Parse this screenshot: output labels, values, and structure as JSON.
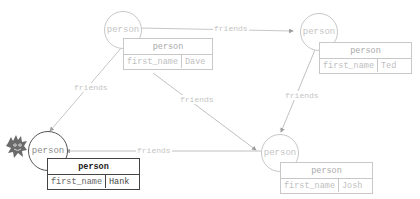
{
  "graph": {
    "nodes": [
      {
        "id": "dave",
        "label": "person",
        "state": "faded",
        "card": {
          "title": "person",
          "key": "first_name",
          "value": "Dave"
        }
      },
      {
        "id": "ted",
        "label": "person",
        "state": "faded",
        "card": {
          "title": "person",
          "key": "first_name",
          "value": "Ted"
        }
      },
      {
        "id": "hank",
        "label": "person",
        "state": "active",
        "card": {
          "title": "person",
          "key": "first_name",
          "value": "Hank"
        }
      },
      {
        "id": "josh",
        "label": "person",
        "state": "faded",
        "card": {
          "title": "person",
          "key": "first_name",
          "value": "Josh"
        }
      }
    ],
    "edges": [
      {
        "from": "dave",
        "to": "ted",
        "label": "friends"
      },
      {
        "from": "dave",
        "to": "hank",
        "label": "friends"
      },
      {
        "from": "dave",
        "to": "josh",
        "label": "friends"
      },
      {
        "from": "ted",
        "to": "josh",
        "label": "friends"
      },
      {
        "from": "josh",
        "to": "hank",
        "label": "friends"
      }
    ]
  },
  "mascot": {
    "icon": "gremlin-mascot-icon"
  },
  "colors": {
    "faded": "#c8c8c8",
    "active": "#444444",
    "edge": "#b0b0b0"
  }
}
